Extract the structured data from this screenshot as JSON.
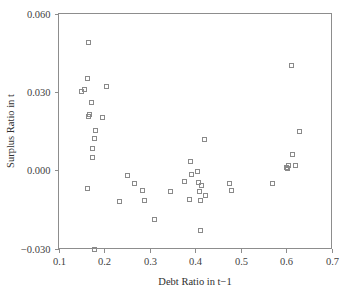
{
  "chart_data": {
    "type": "scatter",
    "title": "",
    "xlabel": "Debt Ratio in t−1",
    "ylabel": "Surplus Ratio in t",
    "xlim": [
      0.1,
      0.7
    ],
    "ylim": [
      -0.03,
      0.06
    ],
    "grid": false,
    "legend": null,
    "marker_style": "open-square",
    "marker_color": "#8a8a8a",
    "frame_color": "#8d8d8d",
    "xticks": [
      0.1,
      0.2,
      0.3,
      0.4,
      0.5,
      0.6,
      0.7
    ],
    "xtick_labels": [
      "0.1",
      "0.2",
      "0.3",
      "0.4",
      "0.5",
      "0.6",
      "0.7"
    ],
    "yticks": [
      -0.03,
      0.0,
      0.03,
      0.06
    ],
    "ytick_labels": [
      "−0.030",
      "0.000",
      "0.030",
      "0.060"
    ],
    "series": [
      {
        "name": "observations",
        "points": [
          [
            0.164,
            0.0492
          ],
          [
            0.163,
            0.0354
          ],
          [
            0.15,
            0.0305
          ],
          [
            0.156,
            0.0311
          ],
          [
            0.205,
            0.0321
          ],
          [
            0.172,
            0.026
          ],
          [
            0.168,
            0.0215
          ],
          [
            0.165,
            0.0206
          ],
          [
            0.196,
            0.0205
          ],
          [
            0.181,
            0.0152
          ],
          [
            0.179,
            0.0123
          ],
          [
            0.174,
            0.0083
          ],
          [
            0.174,
            0.005
          ],
          [
            0.163,
            -0.007
          ],
          [
            0.179,
            -0.03
          ],
          [
            0.232,
            -0.0118
          ],
          [
            0.251,
            -0.0019
          ],
          [
            0.266,
            -0.0051
          ],
          [
            0.284,
            -0.0075
          ],
          [
            0.288,
            -0.0114
          ],
          [
            0.31,
            -0.0186
          ],
          [
            0.345,
            -0.008
          ],
          [
            0.376,
            -0.0043
          ],
          [
            0.388,
            0.0037
          ],
          [
            0.386,
            -0.0109
          ],
          [
            0.392,
            -0.0015
          ],
          [
            0.404,
            -0.0002
          ],
          [
            0.406,
            -0.0044
          ],
          [
            0.409,
            -0.0079
          ],
          [
            0.41,
            -0.0114
          ],
          [
            0.41,
            -0.023
          ],
          [
            0.414,
            -0.0058
          ],
          [
            0.419,
            0.0119
          ],
          [
            0.421,
            -0.0097
          ],
          [
            0.474,
            -0.005
          ],
          [
            0.479,
            -0.0075
          ],
          [
            0.57,
            -0.005
          ],
          [
            0.601,
            0.0014
          ],
          [
            0.602,
            0.0009
          ],
          [
            0.604,
            0.0019
          ],
          [
            0.611,
            0.0403
          ],
          [
            0.613,
            0.0063
          ],
          [
            0.619,
            0.0021
          ],
          [
            0.628,
            0.015
          ]
        ]
      }
    ]
  },
  "axes": {
    "x_title": "Debt Ratio in t−1",
    "y_title": "Surplus Ratio in t"
  }
}
